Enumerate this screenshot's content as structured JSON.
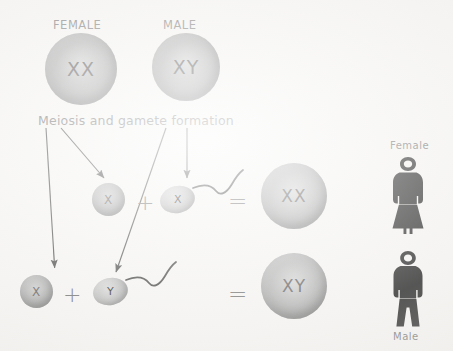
{
  "diagram": {
    "title_present": false,
    "background_color": "#f4f3f1",
    "ink_color": "#4a4a4a",
    "label_color": "#6e6e6e",
    "cell_color_light": "#cdcdcd",
    "cell_color_dark": "#767676",
    "figure_color": "#111111"
  },
  "parents": {
    "female": {
      "label": "FEMALE",
      "chromosomes": "XX"
    },
    "male": {
      "label": "MALE",
      "chromosomes": "XY"
    }
  },
  "process": {
    "label": "Meiosis and gamete formation",
    "arrow_count": 4
  },
  "crosses": [
    {
      "egg": {
        "chromosome": "X",
        "type": "egg"
      },
      "plus": "+",
      "sperm": {
        "chromosome": "X",
        "type": "sperm"
      },
      "equals": "=",
      "zygote": {
        "chromosomes": "XX"
      },
      "outcome_label": "Female"
    },
    {
      "egg": {
        "chromosome": "X",
        "type": "egg"
      },
      "plus": "+",
      "sperm": {
        "chromosome": "Y",
        "type": "sperm"
      },
      "equals": "=",
      "zygote": {
        "chromosomes": "XY"
      },
      "outcome_label": "Male"
    }
  ],
  "outcomes": {
    "female": {
      "label": "Female",
      "label_position": "above",
      "icon": "female-figure-icon"
    },
    "male": {
      "label": "Male",
      "label_position": "below",
      "icon": "male-figure-icon"
    }
  }
}
